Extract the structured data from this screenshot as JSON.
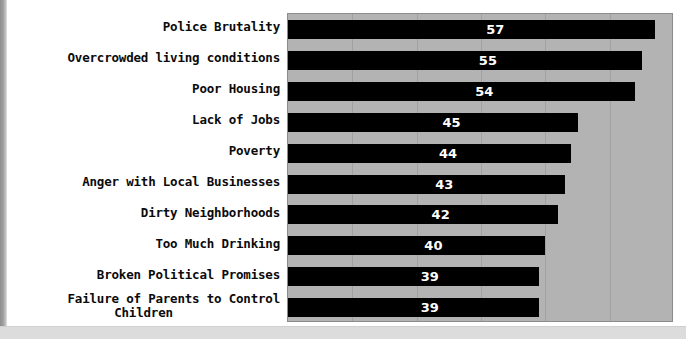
{
  "chart_data": {
    "type": "bar",
    "orientation": "horizontal",
    "title": "",
    "subtitle": "",
    "xlabel": "",
    "ylabel": "",
    "xlim": [
      0,
      60
    ],
    "grid": true,
    "gridlines_x": [
      10,
      20,
      30,
      40,
      50
    ],
    "legend": null,
    "categories": [
      "Police Brutality",
      "Overcrowded living conditions",
      "Poor Housing",
      "Lack of Jobs",
      "Poverty",
      "Anger with Local Businesses",
      "Dirty Neighborhoods",
      "Too Much Drinking",
      "Broken Political Promises",
      "Failure of Parents to Control Children"
    ],
    "values": [
      57,
      55,
      54,
      45,
      44,
      43,
      42,
      40,
      39,
      39
    ],
    "bar_color": "#000000",
    "plot_background": "#b3b3b3",
    "value_label_color": "#ffffff"
  },
  "rows": [
    {
      "label_line1": "Police Brutality",
      "label_line2": "",
      "value": "57"
    },
    {
      "label_line1": "Overcrowded living conditions",
      "label_line2": "",
      "value": "55"
    },
    {
      "label_line1": "Poor Housing",
      "label_line2": "",
      "value": "54"
    },
    {
      "label_line1": "Lack of Jobs",
      "label_line2": "",
      "value": "45"
    },
    {
      "label_line1": "Poverty",
      "label_line2": "",
      "value": "44"
    },
    {
      "label_line1": "Anger with Local Businesses",
      "label_line2": "",
      "value": "43"
    },
    {
      "label_line1": "Dirty Neighborhoods",
      "label_line2": "",
      "value": "42"
    },
    {
      "label_line1": "Too Much Drinking",
      "label_line2": "",
      "value": "40"
    },
    {
      "label_line1": "Broken Political Promises",
      "label_line2": "",
      "value": "39"
    },
    {
      "label_line1": "Failure of Parents to Control",
      "label_line2": "Children",
      "value": "39"
    }
  ]
}
